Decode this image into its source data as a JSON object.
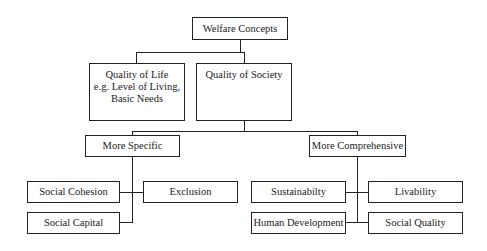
{
  "diagram": {
    "type": "hierarchy",
    "root": "Welfare Concepts",
    "nodes": {
      "welfare_concepts": "Welfare Concepts",
      "quality_of_life": "Quality of Life\ne.g. Level of Living,\nBasic Needs",
      "quality_of_life_lines": [
        "Quality of Life",
        "e.g. Level of Living,",
        "Basic Needs"
      ],
      "quality_of_society": "Quality of Society",
      "more_specific": "More Specific",
      "more_comprehensive": "More Comprehensive",
      "social_cohesion": "Social Cohesion",
      "exclusion": "Exclusion",
      "social_capital": "Social Capital",
      "sustainability": "Sustainabilty",
      "livability": "Livability",
      "human_development": "Human Development",
      "social_quality": "Social Quality"
    },
    "edges": [
      [
        "Welfare Concepts",
        "Quality of Life"
      ],
      [
        "Welfare Concepts",
        "Quality of Society"
      ],
      [
        "Quality of Society",
        "More Specific"
      ],
      [
        "Quality of Society",
        "More Comprehensive"
      ],
      [
        "More Specific",
        "Social Cohesion"
      ],
      [
        "More Specific",
        "Exclusion"
      ],
      [
        "More Specific",
        "Social Capital"
      ],
      [
        "More Comprehensive",
        "Sustainabilty"
      ],
      [
        "More Comprehensive",
        "Livability"
      ],
      [
        "More Comprehensive",
        "Human Development"
      ],
      [
        "More Comprehensive",
        "Social Quality"
      ]
    ]
  }
}
